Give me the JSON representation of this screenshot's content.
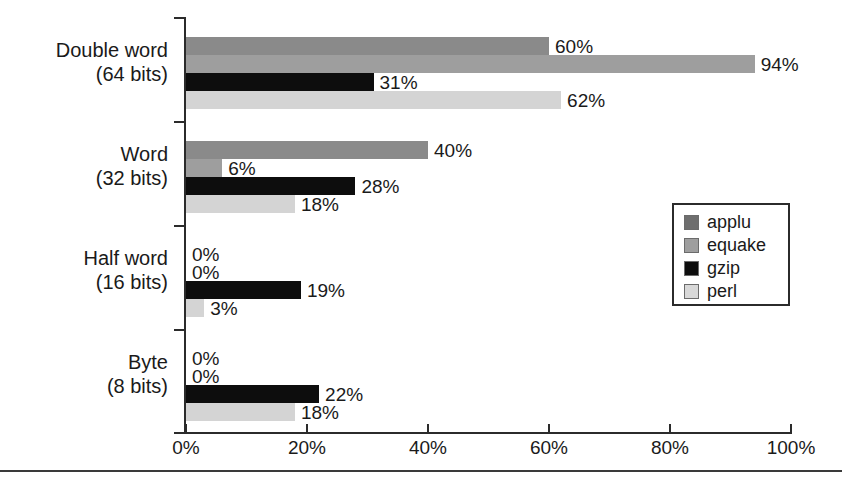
{
  "chart_data": {
    "type": "bar",
    "orientation": "horizontal",
    "title": "",
    "subtitle": "",
    "xlabel": "",
    "ylabel": "",
    "xlim": [
      0,
      100
    ],
    "xtick_labels": [
      "0%",
      "20%",
      "40%",
      "60%",
      "80%",
      "100%"
    ],
    "xtick_values": [
      0,
      20,
      40,
      60,
      80,
      100
    ],
    "grid": false,
    "legend_position": "middle-right",
    "value_label_suffix": "%",
    "categories": [
      "Double word\n(64 bits)",
      "Word\n(32 bits)",
      "Half word\n(16 bits)",
      "Byte\n(8 bits)"
    ],
    "category_lines": [
      [
        "Double word",
        "(64 bits)"
      ],
      [
        "Word",
        "(32 bits)"
      ],
      [
        "Half word",
        "(16 bits)"
      ],
      [
        "Byte",
        "(8 bits)"
      ]
    ],
    "series": [
      {
        "name": "applu",
        "color": "#8a8a8a",
        "values": [
          60,
          40,
          0,
          0
        ],
        "labels": [
          "60%",
          "40%",
          "0%",
          "0%"
        ]
      },
      {
        "name": "equake",
        "color": "#9e9e9e",
        "values": [
          94,
          6,
          0,
          0
        ],
        "labels": [
          "94%",
          "6%",
          "0%",
          "0%"
        ]
      },
      {
        "name": "gzip",
        "color": "#0d0d0d",
        "values": [
          31,
          28,
          19,
          22
        ],
        "labels": [
          "31%",
          "28%",
          "19%",
          "22%"
        ]
      },
      {
        "name": "perl",
        "color": "#d4d4d4",
        "values": [
          62,
          18,
          3,
          18
        ],
        "labels": [
          "62%",
          "18%",
          "3%",
          "18%"
        ]
      }
    ]
  },
  "legend": {
    "items": [
      {
        "label": "applu"
      },
      {
        "label": "equake"
      },
      {
        "label": "gzip"
      },
      {
        "label": "perl"
      }
    ]
  },
  "axis": {
    "x_ticks": [
      {
        "label": "0%"
      },
      {
        "label": "20%"
      },
      {
        "label": "40%"
      },
      {
        "label": "60%"
      },
      {
        "label": "80%"
      },
      {
        "label": "100%"
      }
    ]
  },
  "caption": {
    "text": ""
  }
}
